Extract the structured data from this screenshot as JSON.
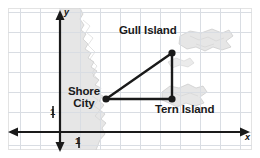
{
  "figure": {
    "background_color": "#ffffff",
    "grid_color": "#d9dde3",
    "land_color": "#e4e4e4",
    "land_outline_color": "#bdbdbd",
    "axis_color": "#1a1a1a",
    "line_color": "#1a1a1a"
  },
  "axes": {
    "x_label": "x",
    "y_label": "y",
    "x_tick_label": "1",
    "y_tick_label": "1",
    "x_axis_y_pixel": 132,
    "y_axis_x_pixel": 60,
    "grid_spacing_px": 20
  },
  "points": [
    {
      "name": "Shore City",
      "label": "Shore\nCity",
      "label_line1": "Shore",
      "label_line2": "City",
      "x_px": 106,
      "y_px": 99,
      "grid_x": 2.3,
      "grid_y": 1.65
    },
    {
      "name": "Gull Island",
      "label": "Gull Island",
      "label_line1": "Gull Island",
      "x_px": 172,
      "y_px": 53,
      "grid_x": 5.6,
      "grid_y": 3.95
    },
    {
      "name": "Tern Island",
      "label": "Tern Island",
      "label_line1": "Tern Island",
      "x_px": 172,
      "y_px": 99,
      "grid_x": 5.6,
      "grid_y": 1.65
    }
  ],
  "segments": [
    {
      "from": "Shore City",
      "to": "Gull Island"
    },
    {
      "from": "Gull Island",
      "to": "Tern Island"
    },
    {
      "from": "Tern Island",
      "to": "Shore City"
    }
  ]
}
